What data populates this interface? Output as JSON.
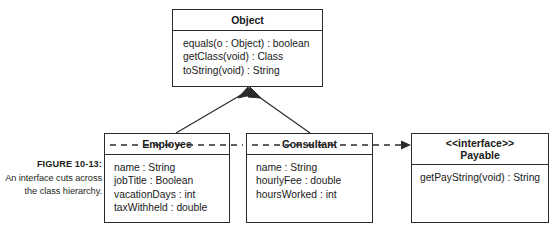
{
  "figure": {
    "caption_label": "FIGURE 10-13:",
    "caption_text": "An interface cuts across the class hierarchy.",
    "background_color": "#ffffff",
    "line_color": "#2b2b2b",
    "text_color": "#1a1a1a"
  },
  "diagram": {
    "type": "uml-class-diagram",
    "classes": [
      {
        "id": "object",
        "name": "Object",
        "stereotype": "",
        "members": [
          "equals(o : Object) : boolean",
          "getClass(void) : Class",
          "toString(void) : String"
        ]
      },
      {
        "id": "employee",
        "name": "Employee",
        "stereotype": "",
        "members": [
          "name : String",
          "jobTitle : Boolean",
          "vacationDays : int",
          "taxWithheld : double"
        ]
      },
      {
        "id": "consultant",
        "name": "Consultant",
        "stereotype": "",
        "members": [
          "name : String",
          "hourlyFee : double",
          "hoursWorked : int"
        ]
      },
      {
        "id": "payable",
        "name": "Payable",
        "stereotype": "<<interface>>",
        "members": [
          "getPayString(void) : String"
        ]
      }
    ],
    "relationships": [
      {
        "id": "employee-extends-object",
        "kind": "generalization",
        "line": "solid",
        "arrowhead": "hollow-triangle",
        "from": "Employee",
        "to": "Object"
      },
      {
        "id": "consultant-extends-object",
        "kind": "generalization",
        "line": "solid",
        "arrowhead": "hollow-triangle",
        "from": "Consultant",
        "to": "Object"
      },
      {
        "id": "employee-implements-payable",
        "kind": "realization",
        "line": "dashed",
        "arrowhead": "solid-arrow",
        "from": "Employee",
        "to": "Payable"
      },
      {
        "id": "consultant-implements-payable",
        "kind": "realization",
        "line": "dashed",
        "arrowhead": "solid-arrow",
        "from": "Consultant",
        "to": "Payable"
      }
    ]
  }
}
